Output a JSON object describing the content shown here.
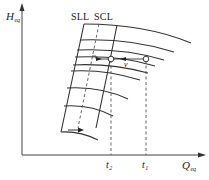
{
  "figure": {
    "type": "diagram",
    "y_axis": {
      "symbol": "H",
      "subscript": "eq"
    },
    "x_axis": {
      "symbol": "Q",
      "subscript": "eq"
    },
    "boundary_lines": [
      {
        "id": "sll",
        "label": "SLL",
        "style": "dashed"
      },
      {
        "id": "scl",
        "label": "SCL",
        "style": "solid"
      }
    ],
    "x_markers": [
      {
        "id": "t2",
        "symbol": "t",
        "subscript": "2"
      },
      {
        "id": "t1",
        "symbol": "t",
        "subscript": "1"
      }
    ],
    "velocity_label": "v",
    "colors": {
      "stroke": "#333333",
      "background": "#ffffff"
    }
  }
}
